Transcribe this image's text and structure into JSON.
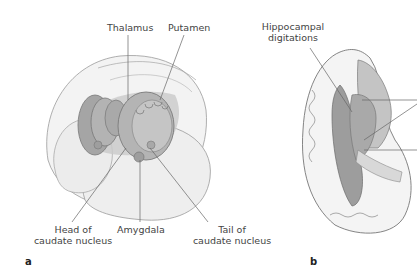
{
  "figure": {
    "panels": [
      {
        "id": "a",
        "letter": "a",
        "labels": {
          "thalamus": "Thalamus",
          "putamen": "Putamen",
          "head_caudate_line1": "Head of",
          "head_caudate_line2": "caudate nucleus",
          "amygdala": "Amygdala",
          "tail_caudate_line1": "Tail of",
          "tail_caudate_line2": "caudate nucleus"
        }
      },
      {
        "id": "b",
        "letter": "b",
        "labels": {
          "hippocampal_line1": "Hippocampal",
          "hippocampal_line2": "digitations"
        }
      }
    ],
    "colors": {
      "outline": "#8a8a8a",
      "hemisphere_fill": "#efefef",
      "structure_fill": "#a9a9a9",
      "shadow_fill": "#c6c6c6",
      "leader_line": "#6a6a6a"
    }
  }
}
